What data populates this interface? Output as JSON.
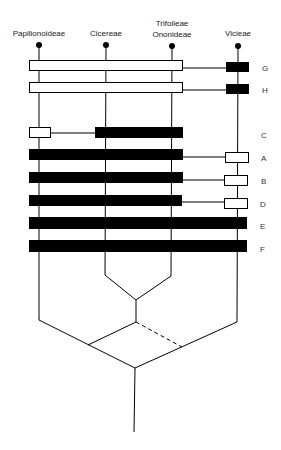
{
  "taxa": [
    {
      "name": "Papilionoideae",
      "lines": [
        "Papilionoideae"
      ],
      "x": 39
    },
    {
      "name": "Cicereae",
      "lines": [
        "Cicereae"
      ],
      "x": 106
    },
    {
      "name": "Trifolieae Ononideae",
      "lines": [
        "Trifolieae",
        "Ononideae"
      ],
      "x": 172
    },
    {
      "name": "Vicieae",
      "lines": [
        "Vicieae"
      ],
      "x": 238
    }
  ],
  "rows": [
    {
      "label": "G",
      "y": 60
    },
    {
      "label": "H",
      "y": 82
    },
    {
      "label": "C",
      "y": 127
    },
    {
      "label": "A",
      "y": 149
    },
    {
      "label": "B",
      "y": 172
    },
    {
      "label": "D",
      "y": 195
    },
    {
      "label": "E",
      "y": 217
    },
    {
      "label": "F",
      "y": 240
    }
  ],
  "colors": {
    "ink": "#000000",
    "background": "#ffffff"
  }
}
